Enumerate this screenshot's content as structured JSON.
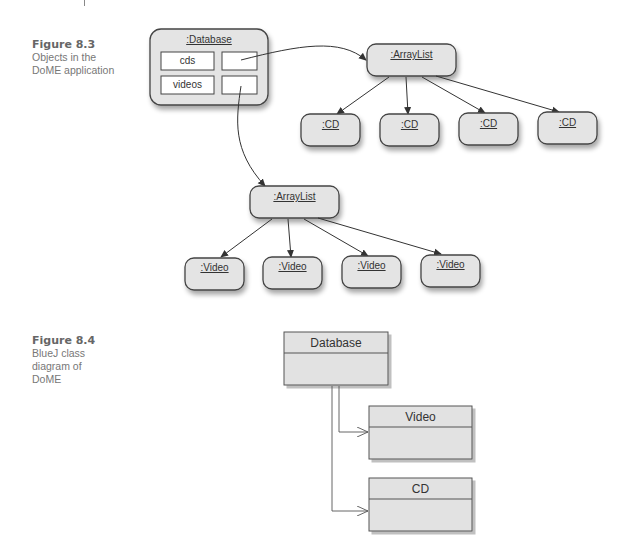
{
  "figure_8_3": {
    "number": "Figure 8.3",
    "caption": "Objects in the DoME application",
    "database": {
      "label": ":Database",
      "fields": [
        {
          "name": "cds"
        },
        {
          "name": "videos"
        }
      ]
    },
    "cd_list": {
      "label": ":ArrayList",
      "items": [
        ":CD",
        ":CD",
        ":CD",
        ":CD"
      ]
    },
    "video_list": {
      "label": ":ArrayList",
      "items": [
        ":Video",
        ":Video",
        ":Video",
        ":Video"
      ]
    }
  },
  "figure_8_4": {
    "number": "Figure 8.4",
    "caption": "BlueJ class diagram of DoME",
    "classes": {
      "database": "Database",
      "video": "Video",
      "cd": "CD"
    }
  },
  "colors": {
    "box_fill": "#e4e4e4",
    "box_stroke": "#444444",
    "line": "#444444",
    "caption_text": "#777777"
  }
}
